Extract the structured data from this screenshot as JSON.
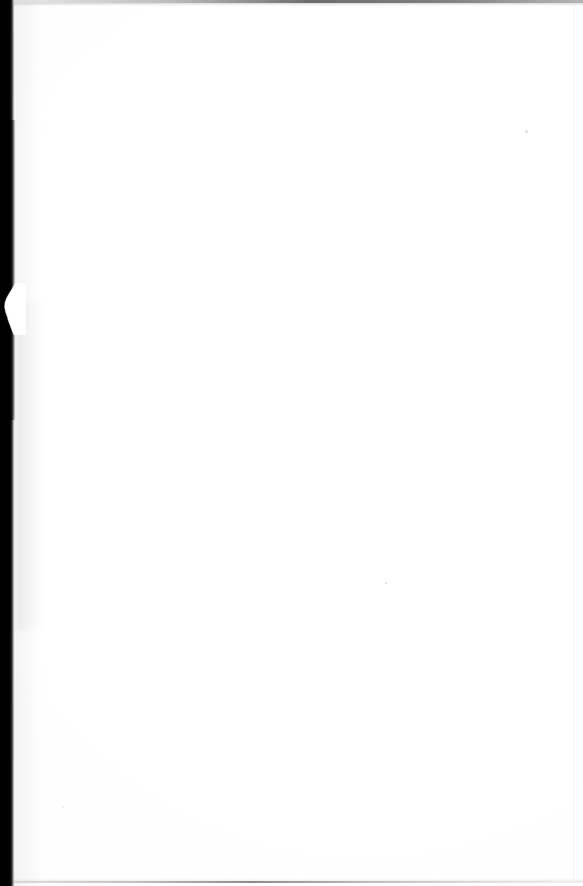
{
  "document": {
    "kind": "scanned-page",
    "content_text": "",
    "page_description": "Blank scanned book page",
    "dimensions": {
      "width": 583,
      "height": 886,
      "unit": "px"
    }
  },
  "page": {
    "background_color": "#ffffff",
    "paper_tone_color": "#fdfdfe",
    "body_text": ""
  },
  "gutter": {
    "name": "binding-gutter",
    "color": "#000000",
    "edge_color": "#8d8d8d",
    "width_px": 15,
    "side": "left",
    "label": ""
  },
  "page_edge": {
    "name": "torn-edge-notch",
    "top_px": 283,
    "height_px": 52,
    "label": ""
  },
  "artifacts": {
    "top_scanline_color": "#282828",
    "bottom_scanline_color": "#5a5a5f",
    "right_margin_line_color": "#a0a0aa",
    "speck_color": "#968c91",
    "caption": "Blank page with left binding shadow and scan edge lines"
  }
}
